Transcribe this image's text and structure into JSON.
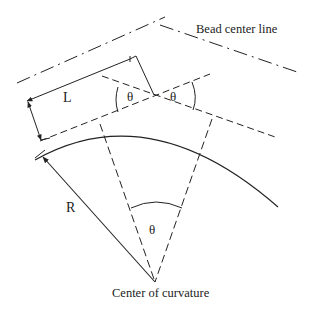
{
  "diagram": {
    "labels": {
      "bead_center_line": "Bead center line",
      "length": "L",
      "radius": "R",
      "theta_left": "θ",
      "theta_right": "θ",
      "theta_center": "θ",
      "center": "Center of curvature"
    },
    "colors": {
      "line": "#222222",
      "background": "#ffffff"
    }
  }
}
